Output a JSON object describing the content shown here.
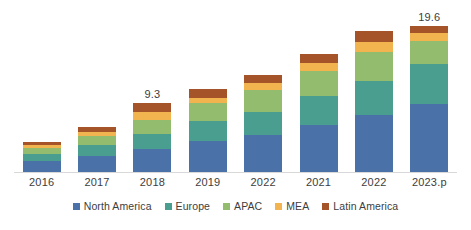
{
  "chart_data": {
    "type": "bar",
    "subtype": "stacked-column",
    "title": "",
    "subtitle": "",
    "xlabel": "",
    "ylabel": "",
    "grid": false,
    "legend_position": "bottom",
    "ylim": [
      0,
      19.6
    ],
    "categories": [
      "2016",
      "2017",
      "2018",
      "2019",
      "2022",
      "2021",
      "2022",
      "2023.p"
    ],
    "series": [
      {
        "name": "North America",
        "color": "#4a72a8",
        "values": [
          1.5,
          2.2,
          3.1,
          4.2,
          5.0,
          6.3,
          7.6,
          9.1
        ]
      },
      {
        "name": "Europe",
        "color": "#4a9e8f",
        "values": [
          0.9,
          1.4,
          2.0,
          2.6,
          3.1,
          3.9,
          4.6,
          5.4
        ]
      },
      {
        "name": "APAC",
        "color": "#93bc6e",
        "values": [
          0.8,
          1.2,
          1.9,
          2.5,
          2.9,
          3.4,
          3.9,
          3.1
        ]
      },
      {
        "name": "MEA",
        "color": "#f2b44e",
        "values": [
          0.4,
          0.6,
          1.0,
          0.7,
          0.9,
          1.0,
          1.3,
          1.1
        ]
      },
      {
        "name": "Latin America",
        "color": "#a5542a",
        "values": [
          0.4,
          0.7,
          1.3,
          1.1,
          1.1,
          1.3,
          1.5,
          0.9
        ]
      }
    ],
    "totals": [
      4.0,
      6.1,
      9.3,
      11.1,
      13.0,
      15.9,
      18.9,
      19.6
    ],
    "point_labels": [
      {
        "category": "2018",
        "text": "9.3"
      },
      {
        "category": "2023.p",
        "text": "19.6"
      }
    ],
    "axis_color": "#d8d8d8",
    "background": "#ffffff",
    "text_color": "#3d3d3d"
  },
  "legend": {
    "items": [
      {
        "label": "North America",
        "color": "#4a72a8"
      },
      {
        "label": "Europe",
        "color": "#4a9e8f"
      },
      {
        "label": "APAC",
        "color": "#93bc6e"
      },
      {
        "label": "MEA",
        "color": "#f2b44e"
      },
      {
        "label": "Latin America",
        "color": "#a5542a"
      }
    ]
  }
}
